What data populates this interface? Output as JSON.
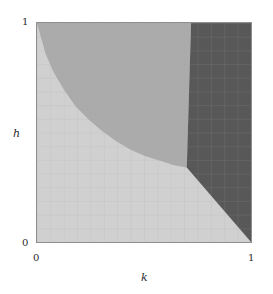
{
  "figure": {
    "background": "#ffffff",
    "frame_color": "#8e8e8e"
  },
  "axes": {
    "x": {
      "label": "k",
      "ticks": [
        "0",
        "1"
      ],
      "tick_values": [
        0,
        1
      ],
      "min": 0,
      "max": 1
    },
    "y": {
      "label": "h",
      "ticks": [
        "0",
        "1"
      ],
      "tick_values": [
        0,
        1
      ],
      "min": 0,
      "max": 1
    }
  },
  "chart_data": {
    "type": "heatmap",
    "title": "",
    "subtitle": "",
    "xlabel": "k",
    "ylabel": "h",
    "xlim": [
      0,
      1
    ],
    "ylim": [
      0,
      1
    ],
    "xticks": [
      0,
      1
    ],
    "yticks": [
      0,
      1
    ],
    "xticklabels": [
      "0",
      "1"
    ],
    "yticklabels": [
      "0",
      "1"
    ],
    "grid": true,
    "grid_divisions": 16,
    "grid_color": "#a8a8a8",
    "legend": "none",
    "annotations": [],
    "regions": [
      {
        "name": "light-region",
        "color": "#d0d0d0",
        "description": "lower-left region below the convex boundary curve",
        "boundary": [
          [
            0.0,
            1.0
          ],
          [
            0.04,
            0.86
          ],
          [
            0.08,
            0.77
          ],
          [
            0.13,
            0.69
          ],
          [
            0.18,
            0.62
          ],
          [
            0.24,
            0.56
          ],
          [
            0.3,
            0.51
          ],
          [
            0.37,
            0.46
          ],
          [
            0.44,
            0.42
          ],
          [
            0.51,
            0.39
          ],
          [
            0.58,
            0.37
          ],
          [
            0.64,
            0.35
          ],
          [
            0.7,
            0.34
          ],
          [
            1.0,
            0.0
          ],
          [
            0.0,
            0.0
          ]
        ]
      },
      {
        "name": "medium-region",
        "color": "#ababab",
        "description": "upper region above the curve and left of the straight dark boundary",
        "boundary": [
          [
            0.0,
            1.0
          ],
          [
            0.72,
            1.0
          ],
          [
            0.7,
            0.34
          ],
          [
            0.64,
            0.35
          ],
          [
            0.58,
            0.37
          ],
          [
            0.51,
            0.39
          ],
          [
            0.44,
            0.42
          ],
          [
            0.37,
            0.46
          ],
          [
            0.3,
            0.51
          ],
          [
            0.24,
            0.56
          ],
          [
            0.18,
            0.62
          ],
          [
            0.13,
            0.69
          ],
          [
            0.08,
            0.77
          ],
          [
            0.04,
            0.86
          ]
        ]
      },
      {
        "name": "dark-region",
        "color": "#585858",
        "description": "right wedge from top-right corner through triple point to bottom-right corner",
        "boundary": [
          [
            0.72,
            1.0
          ],
          [
            1.0,
            1.0
          ],
          [
            1.0,
            0.0
          ],
          [
            0.7,
            0.34
          ]
        ]
      }
    ],
    "triple_point": [
      0.7,
      0.34
    ]
  }
}
